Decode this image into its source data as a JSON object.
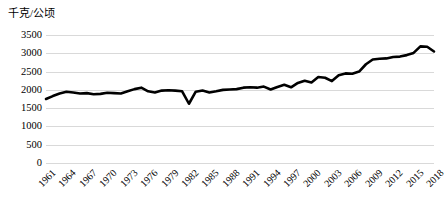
{
  "chart_data": {
    "type": "line",
    "title": "",
    "subtitle": "",
    "xlabel": "",
    "ylabel": "千克/公顷",
    "ylim": [
      0,
      3500
    ],
    "ytick_step": 500,
    "yticks": [
      "3500",
      "3000",
      "2500",
      "2000",
      "1500",
      "1000",
      "500",
      "0"
    ],
    "grid": true,
    "legend": false,
    "legend_position": "none",
    "line_color": "#000000",
    "line_width": 2.6,
    "grid_color": "#D9D9D9",
    "x_tick_labels": [
      "1961",
      "1964",
      "1967",
      "1970",
      "1973",
      "1976",
      "1979",
      "1982",
      "1985",
      "1988",
      "1991",
      "1994",
      "1997",
      "2000",
      "2003",
      "2006",
      "2009",
      "2012",
      "2015",
      "2018"
    ],
    "x_tick_interval": 3,
    "x": [
      1961,
      1962,
      1963,
      1964,
      1965,
      1966,
      1967,
      1968,
      1969,
      1970,
      1971,
      1972,
      1973,
      1974,
      1975,
      1976,
      1977,
      1978,
      1979,
      1980,
      1981,
      1982,
      1983,
      1984,
      1985,
      1986,
      1987,
      1988,
      1989,
      1990,
      1991,
      1992,
      1993,
      1994,
      1995,
      1996,
      1997,
      1998,
      1999,
      2000,
      2001,
      2002,
      2003,
      2004,
      2005,
      2006,
      2007,
      2008,
      2009,
      2010,
      2011,
      2012,
      2013,
      2014,
      2015,
      2016,
      2017,
      2018
    ],
    "series": [
      {
        "name": "单位面积产量",
        "values": [
          1750,
          1830,
          1900,
          1950,
          1930,
          1900,
          1910,
          1880,
          1890,
          1920,
          1910,
          1900,
          1960,
          2020,
          2060,
          1960,
          1930,
          1980,
          1990,
          1980,
          1960,
          1620,
          1950,
          1980,
          1930,
          1960,
          2000,
          2010,
          2020,
          2060,
          2070,
          2060,
          2090,
          2010,
          2080,
          2140,
          2070,
          2190,
          2250,
          2200,
          2350,
          2330,
          2240,
          2400,
          2450,
          2440,
          2500,
          2700,
          2830,
          2850,
          2860,
          2900,
          2910,
          2950,
          3010,
          3190,
          3180,
          3050
        ]
      }
    ]
  }
}
